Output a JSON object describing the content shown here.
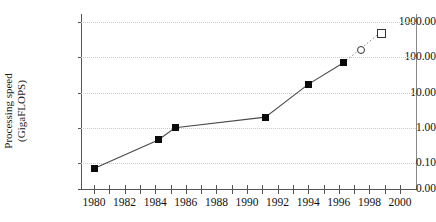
{
  "chart_data": {
    "type": "line",
    "title": "",
    "subtitle": "",
    "xlabel": "",
    "ylabel": "Processing speed\n(GigaFLOPS)",
    "ylabel_line1": "Processing speed",
    "ylabel_line2": "(GigaFLOPS)",
    "y_scale": "log",
    "x_scale": "linear",
    "xlim": [
      1979,
      2000.5
    ],
    "ylim": [
      0.0,
      1000.0
    ],
    "grid": true,
    "grid_style": "dotted horizontal",
    "legend": "none",
    "y_ticks": [
      {
        "label": "0.00",
        "value": 0.0
      },
      {
        "label": "0.10",
        "value": 0.1
      },
      {
        "label": "1.00",
        "value": 1.0
      },
      {
        "label": "10.00",
        "value": 10.0
      },
      {
        "label": "100.00",
        "value": 100.0
      },
      {
        "label": "1000.00",
        "value": 1000.0
      }
    ],
    "x_ticks_labeled": [
      "1980",
      "1982",
      "1984",
      "1986",
      "1988",
      "1990",
      "1992",
      "1994",
      "1996",
      "1998",
      "2000"
    ],
    "x_ticks_minor_step": 1,
    "series": [
      {
        "name": "measured",
        "marker": "filled-square",
        "line": "solid",
        "points": [
          {
            "x": 1980.0,
            "y": 0.07
          },
          {
            "x": 1984.2,
            "y": 0.45
          },
          {
            "x": 1985.3,
            "y": 1.0
          },
          {
            "x": 1991.2,
            "y": 2.0
          },
          {
            "x": 1994.0,
            "y": 17.0
          },
          {
            "x": 1996.3,
            "y": 70.0
          }
        ]
      },
      {
        "name": "projected",
        "marker": "open",
        "line": "dotted",
        "points": [
          {
            "x": 1997.4,
            "y": 170.0,
            "marker": "open-circle"
          },
          {
            "x": 1998.7,
            "y": 500.0,
            "marker": "open-square"
          }
        ]
      }
    ]
  }
}
